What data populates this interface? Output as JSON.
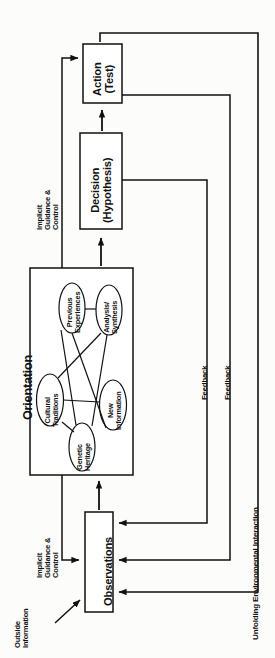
{
  "diagram": {
    "orientation_title": "Orientation",
    "boxes": {
      "action": {
        "line1": "Action",
        "line2": "(Test)"
      },
      "decision": {
        "line1": "Decision",
        "line2": "(Hypothesis)"
      },
      "observations": {
        "line1": "Observations"
      }
    },
    "orientation_nodes": [
      {
        "id": "cultural-traditions",
        "line1": "Cultural",
        "line2": "Traditions"
      },
      {
        "id": "genetic-heritage",
        "line1": "Genetic",
        "line2": "Heritage"
      },
      {
        "id": "new-information",
        "line1": "New",
        "line2": "Information"
      },
      {
        "id": "previous-experiences",
        "line1": "Previous",
        "line2": "Experiences"
      },
      {
        "id": "analysis-synthesis",
        "line1": "Analysis/",
        "line2": "Synthesis"
      }
    ],
    "annotations": {
      "implicit_upper": {
        "line1": "Implicit",
        "line2": "Guidance &",
        "line3": "Control"
      },
      "implicit_lower": {
        "line1": "Implicit",
        "line2": "Guidance &",
        "line3": "Control"
      },
      "outside_information": {
        "line1": "Outside",
        "line2": "Information"
      },
      "feedback_1": "Feedback",
      "feedback_2": "Feedback",
      "unfolding": "Unfolding Environmental Interaction"
    },
    "colors": {
      "stroke": "#111111",
      "text": "#111111",
      "background": "#fcfcfb",
      "box_fill": "#ffffff"
    }
  }
}
